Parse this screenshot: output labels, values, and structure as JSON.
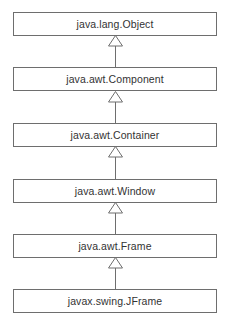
{
  "diagram": {
    "type": "class-inheritance-hierarchy",
    "classes": [
      {
        "name": "java.lang.Object"
      },
      {
        "name": "java.awt.Component"
      },
      {
        "name": "java.awt.Container"
      },
      {
        "name": "java.awt.Window"
      },
      {
        "name": "java.awt.Frame"
      },
      {
        "name": "javax.swing.JFrame"
      }
    ],
    "relations": [
      {
        "from": "java.awt.Component",
        "to": "java.lang.Object",
        "type": "inherits"
      },
      {
        "from": "java.awt.Container",
        "to": "java.awt.Component",
        "type": "inherits"
      },
      {
        "from": "java.awt.Window",
        "to": "java.awt.Container",
        "type": "inherits"
      },
      {
        "from": "java.awt.Frame",
        "to": "java.awt.Window",
        "type": "inherits"
      },
      {
        "from": "javax.swing.JFrame",
        "to": "java.awt.Frame",
        "type": "inherits"
      }
    ],
    "colors": {
      "border": "#6e6e6e",
      "text": "#333333",
      "background": "#ffffff"
    }
  }
}
